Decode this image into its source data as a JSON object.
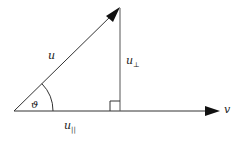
{
  "diagram": {
    "vectors": {
      "u": {
        "label": "u",
        "from": [
          14,
          111
        ],
        "to": [
          120,
          7
        ]
      },
      "v": {
        "label": "v",
        "from": [
          14,
          111
        ],
        "to": [
          220,
          111
        ]
      }
    },
    "components": {
      "perpendicular": {
        "label": "u",
        "subscript": "⊥"
      },
      "parallel": {
        "label": "u",
        "subscript": "||"
      }
    },
    "angle": {
      "label": "ϑ"
    },
    "colors": {
      "line": "#333333",
      "background": "#ffffff"
    }
  }
}
